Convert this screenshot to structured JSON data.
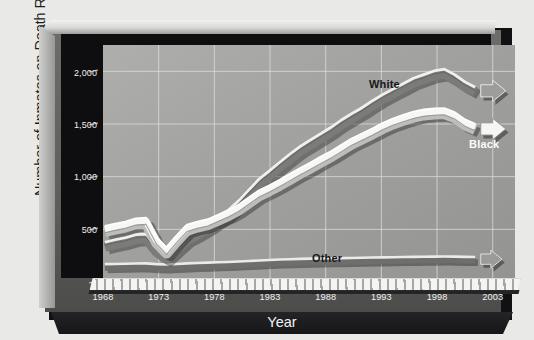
{
  "chart_data": {
    "type": "line",
    "title": "",
    "xlabel": "Year",
    "ylabel": "Number of Inmates on Death Row",
    "xlim": [
      1968,
      2005
    ],
    "ylim": [
      0,
      2250
    ],
    "grid": true,
    "legend_position": "inline-annotation",
    "x_ticks": [
      "1968",
      "1973",
      "1978",
      "1983",
      "1988",
      "1993",
      "1998",
      "2003"
    ],
    "x_tick_values": [
      1968,
      1973,
      1978,
      1983,
      1988,
      1993,
      1998,
      2003
    ],
    "y_ticks": [
      "0",
      "500",
      "1,000",
      "1,500",
      "2,000"
    ],
    "y_tick_values": [
      0,
      500,
      1000,
      1500,
      2000
    ],
    "x": [
      1968,
      1969,
      1970,
      1971,
      1972,
      1973,
      1974,
      1975,
      1976,
      1977,
      1978,
      1979,
      1980,
      1981,
      1982,
      1983,
      1984,
      1985,
      1986,
      1987,
      1988,
      1989,
      1990,
      1991,
      1992,
      1993,
      1994,
      1995,
      1996,
      1997,
      1998,
      1999,
      2000,
      2001,
      2002,
      2003,
      2004
    ],
    "series": [
      {
        "name": "White",
        "color": "#8f8f8d",
        "values": [
          243,
          271,
          293,
          327,
          334,
          192,
          112,
          218,
          320,
          378,
          445,
          520,
          595,
          700,
          820,
          940,
          1030,
          1125,
          1215,
          1300,
          1370,
          1440,
          1510,
          1590,
          1660,
          1725,
          1800,
          1870,
          1930,
          1990,
          2050,
          2090,
          2130,
          2150,
          2090,
          2010,
          1950
        ]
      },
      {
        "name": "Black",
        "color": "#f2f2f0",
        "values": [
          406,
          432,
          455,
          490,
          498,
          285,
          168,
          300,
          420,
          455,
          480,
          530,
          580,
          640,
          720,
          800,
          855,
          915,
          980,
          1045,
          1105,
          1170,
          1230,
          1300,
          1370,
          1425,
          1480,
          1540,
          1590,
          1630,
          1665,
          1690,
          1700,
          1705,
          1660,
          1580,
          1530
        ]
      },
      {
        "name": "Other",
        "color": "#dededc",
        "values": [
          12,
          14,
          16,
          18,
          20,
          12,
          8,
          14,
          20,
          24,
          28,
          32,
          36,
          40,
          46,
          52,
          58,
          62,
          66,
          70,
          72,
          74,
          76,
          78,
          80,
          82,
          84,
          86,
          88,
          90,
          92,
          93,
          94,
          95,
          94,
          92,
          90
        ]
      }
    ],
    "annotations": [
      {
        "text": "White",
        "series": "White"
      },
      {
        "text": "Black",
        "series": "Black"
      },
      {
        "text": "Other",
        "series": "Other"
      }
    ]
  },
  "colors": {
    "page_background": "#e9e9e7",
    "plot_background": "#a2a2a0",
    "frame_dark": "#111113",
    "frame_face": "#5e5e5c",
    "gridline": "#e2e2e0",
    "tick_text": "#f1f1ef",
    "axis_title": "#1a1a1a"
  }
}
